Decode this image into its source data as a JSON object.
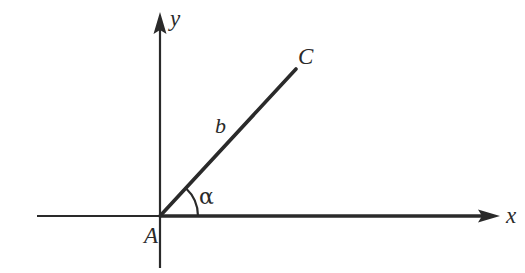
{
  "figure": {
    "kind": "geometry-diagram",
    "background_color": "#ffffff",
    "stroke_color": "#2a2a2a",
    "labels": {
      "axis_y": "y",
      "axis_x": "x",
      "point_c": "C",
      "point_a": "A",
      "side_b": "b",
      "angle_alpha": "α"
    },
    "geometry": {
      "origin": {
        "x": 160,
        "y": 216
      },
      "x_axis": {
        "x1": 37,
        "y1": 216,
        "x2": 500,
        "y2": 216
      },
      "y_axis": {
        "x1": 160,
        "y1": 268,
        "x2": 160,
        "y2": 12
      },
      "ray_ac": {
        "x1": 160,
        "y1": 216,
        "x2": 296,
        "y2": 69
      },
      "angle_arc": {
        "cx": 160,
        "cy": 216,
        "radius": 38,
        "start_deg": 0,
        "end_deg": 47
      },
      "angle_degrees": 47
    }
  }
}
